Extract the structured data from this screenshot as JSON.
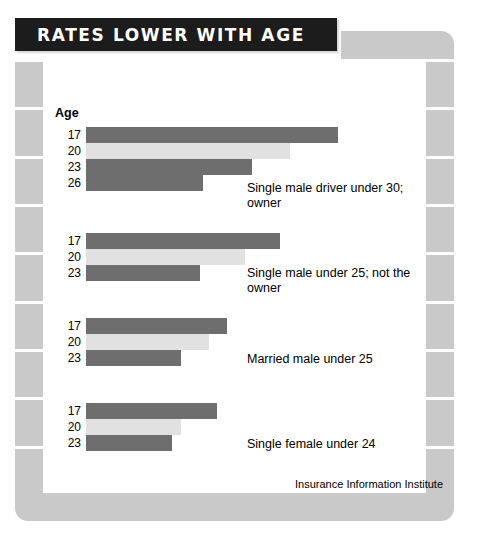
{
  "header": {
    "title": "RATES LOWER WITH AGE"
  },
  "credit": "Insurance Information Institute",
  "axis_title": "Age",
  "chart_data": {
    "type": "bar",
    "title": "RATES LOWER WITH AGE",
    "orientation": "horizontal",
    "xlabel": "",
    "ylabel": "Age",
    "grid": false,
    "legend": null,
    "colors": {
      "dark_bar": "#6e6e6e",
      "light_bar": "#e1e1e1",
      "title_bar": "#1c1c1c",
      "frame": "#c9c9c9"
    },
    "groups": [
      {
        "caption": "Single male driver under 30; owner",
        "categories": [
          "17",
          "20",
          "23",
          "26"
        ],
        "values": [
          252,
          204,
          166,
          117
        ],
        "shades": [
          "dark",
          "light",
          "dark",
          "dark"
        ]
      },
      {
        "caption": "Single male under 25; not the owner",
        "categories": [
          "17",
          "20",
          "23"
        ],
        "values": [
          194,
          159,
          114
        ],
        "shades": [
          "dark",
          "light",
          "dark"
        ]
      },
      {
        "caption": "Married male under 25",
        "categories": [
          "17",
          "20",
          "23"
        ],
        "values": [
          141,
          123,
          95
        ],
        "shades": [
          "dark",
          "light",
          "dark"
        ]
      },
      {
        "caption": "Single female under 24",
        "categories": [
          "17",
          "20",
          "23"
        ],
        "values": [
          131,
          95,
          86
        ],
        "shades": [
          "dark",
          "light",
          "dark"
        ]
      }
    ]
  },
  "frame": {
    "left_segments": 9,
    "right_segments": 9
  }
}
